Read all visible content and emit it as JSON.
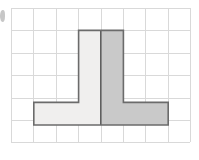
{
  "figure": {
    "title": "Shaded composite shape on square grid",
    "background_color": "#ffffff",
    "width": 199,
    "height": 160
  },
  "grid": {
    "label": "square grid",
    "columns": 8,
    "rows": 6,
    "cell_size": 22.4,
    "origin_x": 11,
    "origin_y": 8,
    "line_color": "#d9d9d9",
    "line_width": 1
  },
  "shape": {
    "label": "composite T-shaped polygon",
    "outline_color": "#6b6b6b",
    "outline_width": 1.6,
    "divider_color": "#5f5f5f",
    "divider_width": 1.6,
    "fill_left": "#f0efee",
    "fill_right": "#c9c9c9",
    "divider_x": 100.8,
    "vertices": [
      [
        78.6,
        30.4
      ],
      [
        123.4,
        30.4
      ],
      [
        123.4,
        102.4
      ],
      [
        168.2,
        102.4
      ],
      [
        168.2,
        125.0
      ],
      [
        33.8,
        125.0
      ],
      [
        33.8,
        102.4
      ],
      [
        78.6,
        102.4
      ]
    ],
    "parts": {
      "stem_label": "vertical stem",
      "stem_width_cells": 2,
      "stem_height_cells": 4,
      "base_label": "horizontal base",
      "base_width_cells": 6,
      "base_height_cells": 1,
      "area_cells": 14
    }
  },
  "artifact": {
    "label": "edge smudge",
    "x": 0,
    "y": 10,
    "width": 5,
    "height": 12,
    "color": "#9a9a9a"
  }
}
